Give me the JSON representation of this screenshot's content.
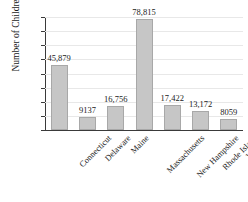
{
  "chart_data": {
    "type": "bar",
    "title": "",
    "xlabel": "",
    "ylabel": "Number of Children",
    "ylim": [
      0,
      80000
    ],
    "ytick_labels": [
      "0",
      "10,000",
      "20,000",
      "30,000",
      "40,000",
      "50,000",
      "60,000",
      "70,000",
      "80,000"
    ],
    "ytick_values": [
      0,
      10000,
      20000,
      30000,
      40000,
      50000,
      60000,
      70000,
      80000
    ],
    "grid": true,
    "legend": "none",
    "categories": [
      "Connecticut",
      "Delaware",
      "Maine",
      "Massachusetts",
      "New Hampshire",
      "Rhode Island",
      "Vermont"
    ],
    "values": [
      45879,
      9137,
      16756,
      78815,
      17422,
      13172,
      8059
    ],
    "value_labels": [
      "45,879",
      "9137",
      "16,756",
      "78,815",
      "17,422",
      "13,172",
      "8059"
    ],
    "bar_color": "#c6c6c6",
    "bar_border_color": "#a8a8a8",
    "axis_color": "#3a3a3a",
    "gridline_color": "#e8e8e8"
  }
}
